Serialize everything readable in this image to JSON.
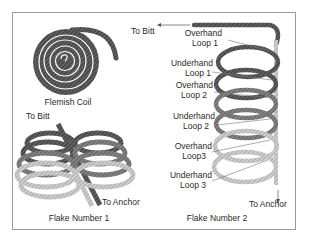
{
  "figure": {
    "flemish_coil": {
      "caption": "Flemish Coil"
    },
    "flake_1": {
      "caption": "Flake Number 1",
      "to_bitt": "To Bitt",
      "to_anchor": "To Anchor"
    },
    "flake_2": {
      "caption": "Flake Number 2",
      "to_bitt": "To Bitt",
      "to_anchor": "To Anchor",
      "loop_labels": [
        {
          "line1": "Overhand",
          "line2": "Loop 1"
        },
        {
          "line1": "Underhand",
          "line2": "Loop 1"
        },
        {
          "line1": "Overhand",
          "line2": "Loop 2"
        },
        {
          "line1": "Underhand",
          "line2": "Loop 2"
        },
        {
          "line1": "Overhand",
          "line2": "Loop3"
        },
        {
          "line1": "Underhand",
          "line2": "Loop 3"
        }
      ]
    },
    "colors": {
      "rope_dark": "#4a4a4a",
      "rope_mid": "#6e6e6e",
      "rope_light": "#b5b5b5",
      "frame": "#9a9a9a"
    }
  }
}
